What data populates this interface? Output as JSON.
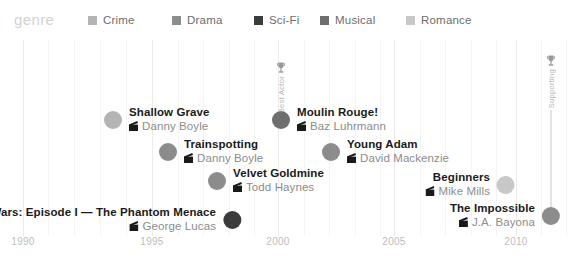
{
  "legend": {
    "title": "genre",
    "items": [
      {
        "label": "Crime",
        "color": "#b4b4b4",
        "x": 88
      },
      {
        "label": "Drama",
        "color": "#8c8c8c",
        "x": 172
      },
      {
        "label": "Sci-Fi",
        "color": "#3c3c3c",
        "x": 254
      },
      {
        "label": "Musical",
        "color": "#6e6e6e",
        "x": 320
      },
      {
        "label": "Romance",
        "color": "#c8c8c8",
        "x": 406
      }
    ]
  },
  "axis": {
    "ticks": [
      {
        "label": "1990",
        "x": 23
      },
      {
        "label": "1995",
        "x": 152
      },
      {
        "label": "2000",
        "x": 278
      },
      {
        "label": "2005",
        "x": 394
      },
      {
        "label": "2010",
        "x": 516
      }
    ]
  },
  "chart_data": {
    "type": "scatter",
    "title": "genre",
    "xlabel": "",
    "ylabel": "",
    "xlim": [
      1989,
      2013
    ],
    "grid": true,
    "legend_position": "top",
    "categories": [
      "Crime",
      "Drama",
      "Sci-Fi",
      "Musical",
      "Romance"
    ],
    "category_colors": {
      "Crime": "#b4b4b4",
      "Drama": "#8c8c8c",
      "Sci-Fi": "#3c3c3c",
      "Musical": "#6e6e6e",
      "Romance": "#c8c8c8"
    },
    "points": [
      {
        "title": "Shallow Grave",
        "director": "Danny Boyle",
        "genre": "Crime",
        "year": 1994,
        "color": "#b4b4b4",
        "x": 113,
        "y": 120,
        "radius": 9,
        "label_side": "right"
      },
      {
        "title": "Trainspotting",
        "director": "Danny Boyle",
        "genre": "Drama",
        "year": 1996,
        "color": "#8c8c8c",
        "x": 168,
        "y": 152,
        "radius": 9,
        "label_side": "right"
      },
      {
        "title": "Velvet Goldmine",
        "director": "Todd Haynes",
        "genre": "Drama",
        "year": 1998,
        "color": "#8c8c8c",
        "x": 217,
        "y": 181,
        "radius": 9,
        "label_side": "right"
      },
      {
        "title": "Star Wars: Episode I — The Phantom Menace",
        "director": "George Lucas",
        "genre": "Sci-Fi",
        "year": 1999,
        "color": "#3c3c3c",
        "x": 232,
        "y": 220,
        "radius": 9,
        "label_side": "left"
      },
      {
        "title": "Moulin Rouge!",
        "director": "Baz Luhrmann",
        "genre": "Musical",
        "year": 2001,
        "color": "#6e6e6e",
        "x": 281,
        "y": 120,
        "radius": 9,
        "label_side": "right",
        "award": "Best Actor"
      },
      {
        "title": "Young Adam",
        "director": "David Mackenzie",
        "genre": "Drama",
        "year": 2003,
        "color": "#8c8c8c",
        "x": 331,
        "y": 152,
        "radius": 9,
        "label_side": "right"
      },
      {
        "title": "Beginners",
        "director": "Mike Mills",
        "genre": "Romance",
        "year": 2010,
        "color": "#c8c8c8",
        "x": 506,
        "y": 185,
        "radius": 9,
        "label_side": "left"
      },
      {
        "title": "The Impossible",
        "director": "J.A. Bayona",
        "genre": "Drama",
        "year": 2012,
        "color": "#8c8c8c",
        "x": 551,
        "y": 216,
        "radius": 9,
        "label_side": "left",
        "award": "Supporting"
      }
    ],
    "annotations": [
      {
        "label": "Best Actor",
        "x": 281,
        "stem_top": 62,
        "stem_bottom": 120,
        "icon": "trophy-icon"
      },
      {
        "label": "Supporting",
        "x": 551,
        "stem_top": 55,
        "stem_bottom": 216,
        "icon": "trophy-icon"
      }
    ],
    "gridlines_major": [
      23,
      152,
      278,
      394,
      516
    ],
    "gridlines_minor": [
      48,
      74,
      100,
      126,
      178,
      203,
      229,
      254,
      304,
      329,
      355,
      380,
      420,
      445,
      471,
      496,
      541,
      566
    ]
  }
}
